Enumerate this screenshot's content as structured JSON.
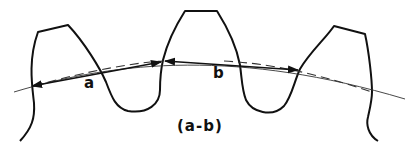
{
  "diagram": {
    "labels": {
      "a": "a",
      "b": "b",
      "caption": "(a-b)"
    },
    "colors": {
      "stroke": "#111111",
      "pitch_line": "#333333",
      "background": "#ffffff"
    },
    "elements": [
      "gear-tooth-profile (three teeth)",
      "pitch-circle (solid thin arc)",
      "chordal-line (dashed)",
      "arrow-a (double-headed, chord between tooth 1 and tooth 2)",
      "arrow-b (double-headed, chord between tooth 2 and tooth 3)"
    ]
  }
}
